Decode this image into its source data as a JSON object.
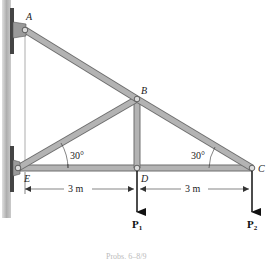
{
  "diagram": {
    "type": "truss",
    "joints": {
      "A": {
        "label": "A",
        "x": 25,
        "y": 30
      },
      "B": {
        "label": "B",
        "x": 137,
        "y": 99
      },
      "C": {
        "label": "C",
        "x": 252,
        "y": 168
      },
      "D": {
        "label": "D",
        "x": 137,
        "y": 168
      },
      "E": {
        "label": "E",
        "x": 18,
        "y": 168
      }
    },
    "members": [
      "AB",
      "BC",
      "EB",
      "BD",
      "ED",
      "DC"
    ],
    "angles": {
      "at_E": "30°",
      "at_C": "30°"
    },
    "dimensions": {
      "ED": "3 m",
      "DC": "3 m"
    },
    "loads": {
      "P1": {
        "symbol": "P",
        "subscript": "1",
        "at": "D"
      },
      "P2": {
        "symbol": "P",
        "subscript": "2",
        "at": "C"
      }
    },
    "caption": "Probs. 6–8/9",
    "colors": {
      "member_fill": "#a9a9a9",
      "member_edge": "#6e6e6e",
      "wall": "#8a8a8a",
      "arrow": "#111111"
    }
  }
}
